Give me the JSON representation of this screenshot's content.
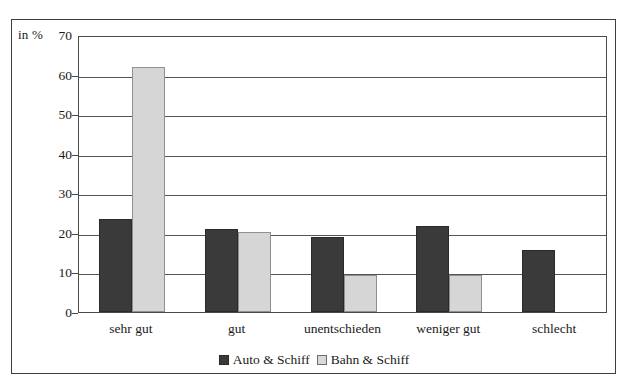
{
  "chart_data": {
    "type": "bar",
    "title": "",
    "subtitle": "",
    "xlabel": "",
    "ylabel": "in %",
    "unit_label": "in %",
    "categories": [
      "sehr gut",
      "gut",
      "unentschieden",
      "weniger gut",
      "schlecht"
    ],
    "series": [
      {
        "name": "Auto & Schiff",
        "color": "#3a3a3a",
        "values": [
          23.5,
          21.0,
          19.0,
          21.8,
          15.6
        ]
      },
      {
        "name": "Bahn & Schiff",
        "color": "#d6d6d6",
        "values": [
          61.8,
          20.2,
          9.3,
          9.3,
          0
        ]
      }
    ],
    "ylim": [
      0,
      70
    ],
    "yticks": [
      0,
      10,
      20,
      30,
      40,
      50,
      60,
      70
    ],
    "ytick_labels": [
      "0",
      "10",
      "20",
      "30",
      "40",
      "50",
      "60",
      "70"
    ],
    "grid": true,
    "legend_position": "bottom",
    "legend": [
      "Auto & Schiff",
      "Bahn & Schiff"
    ]
  }
}
